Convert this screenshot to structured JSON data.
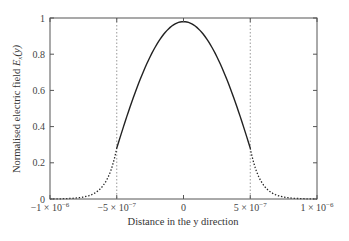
{
  "chart_data": {
    "type": "line",
    "title": "",
    "xlabel": "Distance in the y direction",
    "ylabel": "Normalised electric field E_x(y)",
    "ylabel_parts": {
      "main": "Normalised electric field ",
      "symbol": "E",
      "sub": "x",
      "arg": "(y)"
    },
    "xlim": [
      -1e-06,
      1e-06
    ],
    "ylim": [
      0,
      1
    ],
    "grid": false,
    "legend": null,
    "x_ticks": [
      {
        "value": -1e-06,
        "label": "−1 × 10",
        "exp": "−6"
      },
      {
        "value": -5e-07,
        "label": "−5 × 10",
        "exp": "−7"
      },
      {
        "value": 0,
        "label": "0",
        "exp": ""
      },
      {
        "value": 5e-07,
        "label": "5 × 10",
        "exp": "−7"
      },
      {
        "value": 1e-06,
        "label": "1 × 10",
        "exp": "−6"
      }
    ],
    "y_ticks": [
      {
        "value": 0,
        "label": "0"
      },
      {
        "value": 0.2,
        "label": "0.2"
      },
      {
        "value": 0.4,
        "label": "0.4"
      },
      {
        "value": 0.6,
        "label": "0.6"
      },
      {
        "value": 0.8,
        "label": "0.8"
      },
      {
        "value": 1,
        "label": "1"
      }
    ],
    "vertical_markers": [
      {
        "x": -5e-07,
        "style": "dotted",
        "color": "#999999"
      },
      {
        "x": 5e-07,
        "style": "dotted",
        "color": "#999999"
      }
    ],
    "series": [
      {
        "name": "core field (cosine)",
        "style": "solid",
        "color": "#222222",
        "x": [
          -5e-07,
          -4e-07,
          -3e-07,
          -2e-07,
          -1e-07,
          0,
          1e-07,
          2e-07,
          3e-07,
          4e-07,
          5e-07
        ],
        "values": [
          0.28,
          0.5,
          0.7,
          0.85,
          0.95,
          0.98,
          0.95,
          0.85,
          0.7,
          0.5,
          0.28
        ]
      },
      {
        "name": "evanescent tail (left)",
        "style": "dotted",
        "color": "#222222",
        "x": [
          -1e-06,
          -9e-07,
          -8e-07,
          -7e-07,
          -6e-07,
          -5e-07
        ],
        "values": [
          0.0,
          0.002,
          0.006,
          0.02,
          0.076,
          0.28
        ]
      },
      {
        "name": "evanescent tail (right)",
        "style": "dotted",
        "color": "#222222",
        "x": [
          5e-07,
          6e-07,
          7e-07,
          8e-07,
          9e-07,
          1e-06
        ],
        "values": [
          0.28,
          0.076,
          0.02,
          0.006,
          0.002,
          0.0
        ]
      }
    ],
    "model": {
      "peak": 0.98,
      "k_times_half_width": 1.28,
      "half_width": 5e-07,
      "decay_alpha": 13000000.0
    }
  },
  "colors": {
    "axis": "#555555",
    "curve": "#222222",
    "marker": "#999999"
  }
}
